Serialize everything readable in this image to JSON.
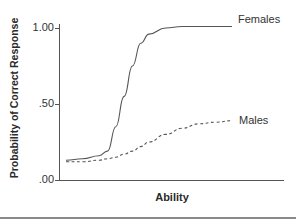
{
  "chart_data": {
    "type": "line",
    "title": "",
    "xlabel": "Ability",
    "ylabel": "Probability of Correct Response",
    "ylim": [
      0,
      1.0
    ],
    "y_ticks": [
      ".00",
      ".50",
      "1.00"
    ],
    "x_ticks": [],
    "grid": false,
    "legend_position": "inline-right",
    "x": [
      0,
      0.1,
      0.2,
      0.25,
      0.3,
      0.35,
      0.4,
      0.45,
      0.5,
      0.6,
      0.7,
      0.8,
      0.9,
      1.0
    ],
    "series": [
      {
        "name": "Females",
        "style": "solid",
        "values": [
          0.13,
          0.14,
          0.16,
          0.19,
          0.35,
          0.55,
          0.75,
          0.9,
          0.96,
          1.0,
          1.01,
          1.01,
          1.01,
          1.01
        ]
      },
      {
        "name": "Males",
        "style": "dashed",
        "values": [
          0.12,
          0.12,
          0.13,
          0.14,
          0.15,
          0.17,
          0.19,
          0.22,
          0.25,
          0.3,
          0.34,
          0.37,
          0.38,
          0.39
        ]
      }
    ]
  },
  "labels": {
    "ylabel": "Probability of Correct Response",
    "xlabel": "Ability",
    "tick_top": "1.00",
    "tick_mid": ".50",
    "tick_bottom": ".00",
    "females": "Females",
    "males": "Males"
  }
}
